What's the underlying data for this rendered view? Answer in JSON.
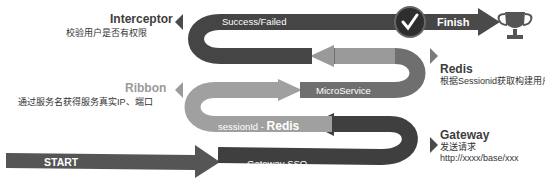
{
  "colors": {
    "dark": "#4a4a4a",
    "medium": "#6f6f6f",
    "light": "#a3a3a3",
    "outline": "#5a5a5a"
  },
  "flow": {
    "start": "START",
    "gateway_band": "Gateway SSO",
    "session_band_prefix": "sessionId - ",
    "session_band_strong": "Redis",
    "microservice_band": "MicroService",
    "result_band": "Success/Failed",
    "finish": "Finish"
  },
  "annotations": {
    "gateway": {
      "title": "Gateway",
      "line1": "发送请求",
      "line2": "http://xxxx/base/xxx"
    },
    "ribbon": {
      "title": "Ribbon",
      "line1": "通过服务名获得服务真实IP、端口"
    },
    "redis": {
      "title": "Redis",
      "line1": "根据Sessionid获取构建用户"
    },
    "interceptor": {
      "title": "Interceptor",
      "line1": "校验用户是否有权限"
    }
  },
  "icons": {
    "check": "check-circle-icon",
    "trophy": "trophy-icon"
  }
}
